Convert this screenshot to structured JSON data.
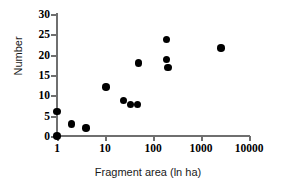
{
  "chart_data": {
    "type": "scatter",
    "title": "",
    "xlabel": "Fragment area (ln ha)",
    "ylabel": "Number",
    "xscale": "log",
    "yscale": "linear",
    "xlim": [
      1,
      10000
    ],
    "ylim": [
      0,
      30
    ],
    "grid": false,
    "legend": null,
    "marker": {
      "shape": "filled-circle",
      "color": "#000000",
      "size_px": 7.5
    },
    "axis_color": "#6f6f6f",
    "xticks": [
      {
        "value": 1,
        "label": "1"
      },
      {
        "value": 10,
        "label": "10"
      },
      {
        "value": 100,
        "label": "100"
      },
      {
        "value": 1000,
        "label": "1000"
      },
      {
        "value": 10000,
        "label": "10000"
      }
    ],
    "yticks": [
      {
        "value": 0,
        "label": "0"
      },
      {
        "value": 5,
        "label": "5"
      },
      {
        "value": 10,
        "label": "10"
      },
      {
        "value": 15,
        "label": "15"
      },
      {
        "value": 20,
        "label": "20"
      },
      {
        "value": 25,
        "label": "25"
      },
      {
        "value": 30,
        "label": "30"
      }
    ],
    "points": [
      {
        "x": 1,
        "y": 6
      },
      {
        "x": 1,
        "y": 0
      },
      {
        "x": 2,
        "y": 3
      },
      {
        "x": 4,
        "y": 2
      },
      {
        "x": 10.5,
        "y": 12
      },
      {
        "x": 24,
        "y": 8.7
      },
      {
        "x": 34,
        "y": 7.8
      },
      {
        "x": 48,
        "y": 7.8
      },
      {
        "x": 50,
        "y": 18
      },
      {
        "x": 190,
        "y": 23.7
      },
      {
        "x": 190,
        "y": 18.8
      },
      {
        "x": 205,
        "y": 16.8
      },
      {
        "x": 2600,
        "y": 21.6
      }
    ]
  }
}
